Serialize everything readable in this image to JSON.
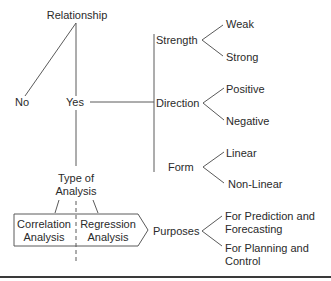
{
  "diagram": {
    "root": {
      "label": "Relationship"
    },
    "no": {
      "label": "No"
    },
    "yes": {
      "label": "Yes"
    },
    "aspects": [
      {
        "label": "Strength",
        "children": [
          "Weak",
          "Strong"
        ]
      },
      {
        "label": "Direction",
        "children": [
          "Positive",
          "Negative"
        ]
      },
      {
        "label": "Form",
        "children": [
          "Linear",
          "Non-Linear"
        ]
      }
    ],
    "type_of_analysis": {
      "line1": "Type of",
      "line2": "Analysis"
    },
    "correlation": {
      "line1": "Correlation",
      "line2": "Analysis"
    },
    "regression": {
      "line1": "Regression",
      "line2": "Analysis"
    },
    "purposes": {
      "label": "Purposes",
      "children": [
        {
          "line1": "For Prediction and",
          "line2": "Forecasting"
        },
        {
          "line1": "For Planning and",
          "line2": "Control"
        }
      ]
    }
  },
  "colors": {
    "line": "#5a5a5a",
    "text": "#2a2a2a",
    "background": "#ffffff"
  }
}
